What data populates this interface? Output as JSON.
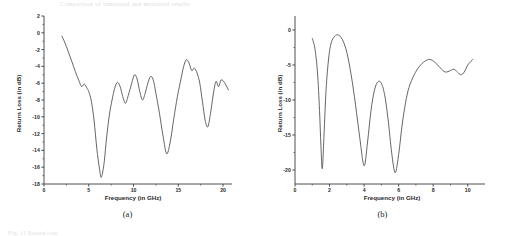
{
  "figure": {
    "faint_header": "Comparison of simulated and measured results",
    "faint_footer": "Fig. 11  Return loss",
    "background": "#ffffff",
    "curve_color": "#4a4a4a",
    "axis_color": "#3a3a3a"
  },
  "panels": [
    {
      "caption": "(a)",
      "chart_data": {
        "type": "line",
        "title": "",
        "xlabel": "Frequency (in GHz)",
        "ylabel": "Return Loss (in dB)",
        "xlim": [
          0,
          21
        ],
        "ylim": [
          -18,
          2
        ],
        "xticks": [
          0,
          5,
          10,
          15,
          20
        ],
        "yticks": [
          2,
          0,
          -2,
          -4,
          -6,
          -8,
          -10,
          -12,
          -14,
          -16,
          -18
        ],
        "xtick_labels": [
          "0",
          "5",
          "10",
          "15",
          "20"
        ],
        "ytick_labels": [
          "2",
          "0",
          "-2",
          "-4",
          "-6",
          "-8",
          "-10",
          "-12",
          "-14",
          "-16",
          "-18"
        ],
        "grid": false,
        "legend": "none",
        "series": [
          {
            "name": "Return Loss",
            "x": [
              2.0,
              2.3,
              2.7,
              3.1,
              3.5,
              3.9,
              4.2,
              4.5,
              4.8,
              5.0,
              5.3,
              5.6,
              5.9,
              6.2,
              6.4,
              6.7,
              7.0,
              7.3,
              7.6,
              7.9,
              8.2,
              8.5,
              8.8,
              9.1,
              9.4,
              9.8,
              10.1,
              10.4,
              10.7,
              11.0,
              11.3,
              11.6,
              11.9,
              12.2,
              12.5,
              12.9,
              13.3,
              13.7,
              14.1,
              14.5,
              14.9,
              15.3,
              15.6,
              15.9,
              16.2,
              16.5,
              16.8,
              17.1,
              17.4,
              17.7,
              18.0,
              18.3,
              18.6,
              18.9,
              19.2,
              19.5,
              19.8,
              20.2,
              20.6
            ],
            "y": [
              -0.4,
              -1.1,
              -2.2,
              -3.4,
              -4.6,
              -5.7,
              -6.4,
              -6.1,
              -6.6,
              -7.0,
              -8.2,
              -10.5,
              -13.8,
              -16.2,
              -17.2,
              -15.6,
              -12.4,
              -9.8,
              -8.0,
              -6.6,
              -5.9,
              -6.4,
              -7.6,
              -8.4,
              -7.5,
              -6.0,
              -5.0,
              -5.5,
              -7.0,
              -8.0,
              -7.2,
              -6.0,
              -5.2,
              -5.6,
              -7.2,
              -9.6,
              -12.3,
              -14.4,
              -13.0,
              -10.2,
              -7.6,
              -5.5,
              -4.0,
              -3.2,
              -3.6,
              -4.5,
              -4.2,
              -4.8,
              -6.0,
              -8.2,
              -10.4,
              -11.2,
              -9.6,
              -7.4,
              -5.8,
              -6.4,
              -5.6,
              -6.0,
              -6.8
            ]
          }
        ]
      }
    },
    {
      "caption": "(b)",
      "chart_data": {
        "type": "line",
        "title": "",
        "xlabel": "Frequency (in GHz)",
        "ylabel": "Return Loss (in dB)",
        "xlim": [
          0,
          11
        ],
        "ylim": [
          -22,
          2
        ],
        "xticks": [
          0,
          2,
          4,
          6,
          8,
          10
        ],
        "yticks": [
          0,
          -5,
          -10,
          -15,
          -20
        ],
        "xtick_labels": [
          "0",
          "2",
          "4",
          "6",
          "8",
          "10"
        ],
        "ytick_labels": [
          "0",
          "-5",
          "-10",
          "-15",
          "-20"
        ],
        "grid": false,
        "legend": "none",
        "series": [
          {
            "name": "Return Loss",
            "x": [
              1.0,
              1.15,
              1.3,
              1.42,
              1.5,
              1.58,
              1.68,
              1.8,
              1.95,
              2.1,
              2.3,
              2.5,
              2.75,
              3.0,
              3.25,
              3.5,
              3.75,
              4.0,
              4.2,
              4.4,
              4.6,
              4.8,
              5.0,
              5.2,
              5.4,
              5.6,
              5.8,
              6.0,
              6.2,
              6.4,
              6.6,
              6.9,
              7.2,
              7.5,
              7.8,
              8.1,
              8.4,
              8.7,
              9.0,
              9.2,
              9.4,
              9.6,
              9.8,
              10.0,
              10.3
            ],
            "y": [
              -1.2,
              -2.6,
              -6.0,
              -11.5,
              -16.5,
              -19.8,
              -15.0,
              -8.5,
              -4.0,
              -1.8,
              -0.9,
              -0.7,
              -1.4,
              -3.2,
              -6.4,
              -10.6,
              -15.4,
              -19.4,
              -16.0,
              -11.5,
              -8.6,
              -7.4,
              -7.6,
              -9.4,
              -13.0,
              -17.6,
              -20.4,
              -17.8,
              -13.6,
              -10.4,
              -8.2,
              -6.4,
              -5.2,
              -4.5,
              -4.2,
              -4.6,
              -5.4,
              -6.0,
              -5.8,
              -5.6,
              -6.0,
              -6.4,
              -6.0,
              -5.0,
              -4.2
            ]
          }
        ]
      }
    }
  ]
}
